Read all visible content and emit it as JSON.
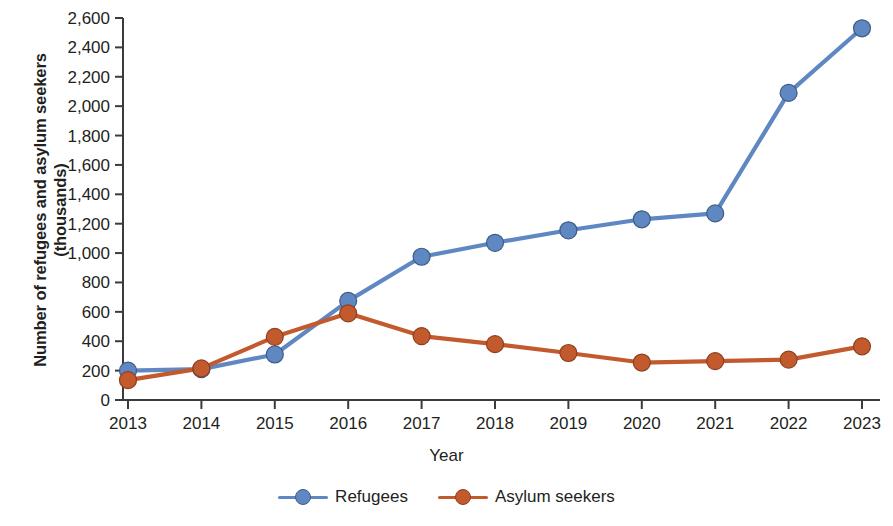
{
  "chart_data": {
    "type": "line",
    "title": "",
    "xlabel": "Year",
    "ylabel": "Number of refugees and asylum seekers\n(thousands)",
    "categories": [
      "2013",
      "2014",
      "2015",
      "2016",
      "2017",
      "2018",
      "2019",
      "2020",
      "2021",
      "2022",
      "2023"
    ],
    "x": [
      2013,
      2014,
      2015,
      2016,
      2017,
      2018,
      2019,
      2020,
      2021,
      2022,
      2023
    ],
    "series": [
      {
        "name": "Refugees",
        "color": "#5F88C3",
        "values": [
          200,
          210,
          310,
          675,
          975,
          1070,
          1155,
          1230,
          1270,
          2090,
          2530
        ]
      },
      {
        "name": "Asylum seekers",
        "color": "#C25A2E",
        "values": [
          135,
          215,
          430,
          590,
          435,
          380,
          320,
          255,
          265,
          275,
          365
        ]
      }
    ],
    "ylim": [
      0,
      2600
    ],
    "yticks": [
      0,
      200,
      400,
      600,
      800,
      1000,
      1200,
      1400,
      1600,
      1800,
      2000,
      2200,
      2400,
      2600
    ],
    "ytick_labels": [
      "0",
      "200",
      "400",
      "600",
      "800",
      "1,000",
      "1,200",
      "1,400",
      "1,600",
      "1,800",
      "2,000",
      "2,200",
      "2,400",
      "2,600"
    ],
    "grid": false,
    "legend_position": "bottom"
  },
  "legend": {
    "items": [
      {
        "label": "Refugees",
        "color": "#5F88C3"
      },
      {
        "label": "Asylum seekers",
        "color": "#C25A2E"
      }
    ]
  },
  "axes": {
    "x_title": "Year",
    "y_title": "Number of refugees and asylum seekers\n(thousands)"
  },
  "colors": {
    "refugees": "#5F88C3",
    "asylum_seekers": "#C25A2E",
    "axis": "#3b3b3b",
    "text": "#231f20"
  }
}
